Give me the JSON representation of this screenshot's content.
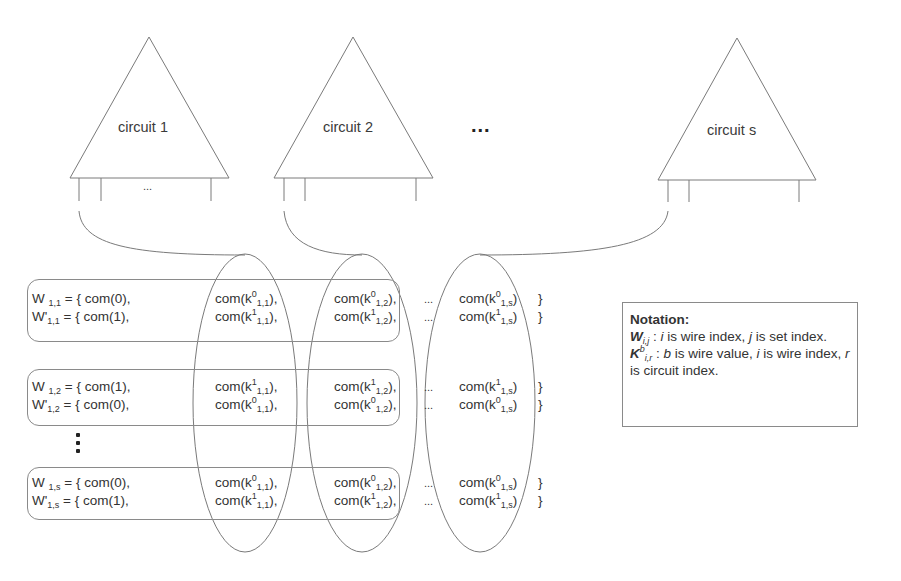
{
  "circuits": [
    {
      "label": "circuit 1",
      "show_wire_ellipsis": true,
      "wire_ellipsis": "..."
    },
    {
      "label": "circuit 2",
      "show_wire_ellipsis": false,
      "wire_ellipsis": ""
    },
    {
      "label": "circuit s",
      "show_wire_ellipsis": false,
      "wire_ellipsis": ""
    }
  ],
  "between_circuits_ellipsis": "...",
  "sets": [
    {
      "rows": [
        {
          "lhs": "W",
          "lhs_prime": "",
          "lhs_sub": "1,1",
          "first": "= { com(0),",
          "cells": [
            {
              "b": "0",
              "sub": "1,1",
              "tail": ","
            },
            {
              "b": "0",
              "sub": "1,2",
              "tail": ","
            },
            {
              "b": "0",
              "sub": "1,s",
              "tail": ""
            }
          ]
        },
        {
          "lhs": "W",
          "lhs_prime": "'",
          "lhs_sub": "1,1",
          "first": "= { com(1),",
          "cells": [
            {
              "b": "1",
              "sub": "1,1",
              "tail": ","
            },
            {
              "b": "1",
              "sub": "1,2",
              "tail": ","
            },
            {
              "b": "1",
              "sub": "1,s",
              "tail": ""
            }
          ]
        }
      ]
    },
    {
      "rows": [
        {
          "lhs": "W",
          "lhs_prime": "",
          "lhs_sub": "1,2",
          "first": "= { com(1),",
          "cells": [
            {
              "b": "1",
              "sub": "1,1",
              "tail": ","
            },
            {
              "b": "1",
              "sub": "1,2",
              "tail": ","
            },
            {
              "b": "1",
              "sub": "1,s",
              "tail": ""
            }
          ]
        },
        {
          "lhs": "W",
          "lhs_prime": "'",
          "lhs_sub": "1,2",
          "first": "= { com(0),",
          "cells": [
            {
              "b": "0",
              "sub": "1,1",
              "tail": ","
            },
            {
              "b": "0",
              "sub": "1,2",
              "tail": ","
            },
            {
              "b": "0",
              "sub": "1,s",
              "tail": ""
            }
          ]
        }
      ]
    },
    {
      "rows": [
        {
          "lhs": "W",
          "lhs_prime": "",
          "lhs_sub": "1,s",
          "first": "= { com(0),",
          "cells": [
            {
              "b": "0",
              "sub": "1,1",
              "tail": ","
            },
            {
              "b": "0",
              "sub": "1,2",
              "tail": ","
            },
            {
              "b": "0",
              "sub": "1,s",
              "tail": ""
            }
          ]
        },
        {
          "lhs": "W",
          "lhs_prime": "'",
          "lhs_sub": "1,s",
          "first": "= { com(1),",
          "cells": [
            {
              "b": "1",
              "sub": "1,1",
              "tail": ","
            },
            {
              "b": "1",
              "sub": "1,2",
              "tail": ","
            },
            {
              "b": "1",
              "sub": "1,s",
              "tail": ""
            }
          ]
        }
      ]
    }
  ],
  "cell_prefix": "com(k",
  "cell_suffix": ")",
  "row_ellipsis": "...",
  "row_close": "}",
  "notation": {
    "title": "Notation:",
    "w_symbol": "W",
    "w_sub": "i,j",
    "w_desc_1": " : ",
    "w_i": "i",
    "w_desc_2": " is wire index, ",
    "w_j": "j",
    "w_desc_3": " is set index.",
    "k_symbol": "K",
    "k_sup": "b",
    "k_sub": "i,r",
    "k_desc_1": " : ",
    "k_b": "b",
    "k_desc_2": " is wire value, ",
    "k_i": "i",
    "k_desc_3": " is wire index, ",
    "k_r": "r",
    "k_desc_4": " is circuit index."
  },
  "colors": {
    "line": "#7a7a7a",
    "text": "#333333",
    "background": "#ffffff"
  }
}
